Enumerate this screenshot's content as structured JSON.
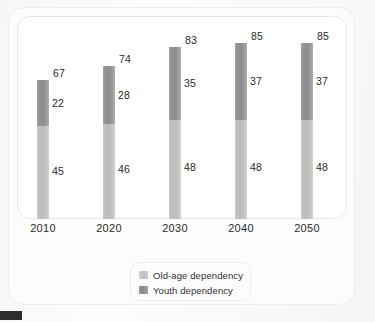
{
  "chart_data": {
    "type": "bar",
    "subtype": "stacked-bar-vertical",
    "title": "",
    "subtitle": "",
    "xlabel": "",
    "ylabel": "",
    "grid": false,
    "axis_visible": false,
    "ylim": [
      0,
      90
    ],
    "stack_order_bottom_to_top": [
      "Old-age dependency",
      "Youth dependency"
    ],
    "categories": [
      "2010",
      "2020",
      "2030",
      "2040",
      "2050"
    ],
    "series": [
      {
        "name": "Old-age dependency",
        "color": "#c2c3c1",
        "values": [
          45,
          46,
          48,
          48,
          48
        ]
      },
      {
        "name": "Youth dependency",
        "color": "#909090",
        "values": [
          22,
          28,
          35,
          37,
          37
        ]
      }
    ],
    "totals": [
      67,
      74,
      83,
      85,
      85
    ],
    "legend": {
      "position": "bottom-center",
      "entries": [
        {
          "label": "Old-age dependency",
          "swatch": "light-gray-swatch",
          "color": "#c2c3c1"
        },
        {
          "label": "Youth dependency",
          "swatch": "dark-gray-swatch",
          "color": "#909090"
        }
      ]
    },
    "annotations": [
      {
        "category": "2010",
        "total_label": "67",
        "youth_label": "22",
        "oldage_label": "45"
      },
      {
        "category": "2020",
        "total_label": "74",
        "youth_label": "28",
        "oldage_label": "46"
      },
      {
        "category": "2030",
        "total_label": "83",
        "youth_label": "35",
        "oldage_label": "48"
      },
      {
        "category": "2040",
        "total_label": "85",
        "youth_label": "37",
        "oldage_label": "48"
      },
      {
        "category": "2050",
        "total_label": "85",
        "youth_label": "37",
        "oldage_label": "48"
      }
    ]
  },
  "bars": [
    {
      "category": "2010",
      "total": "67",
      "youth": "22",
      "oldage": "45"
    },
    {
      "category": "2020",
      "total": "74",
      "youth": "28",
      "oldage": "46"
    },
    {
      "category": "2030",
      "total": "83",
      "youth": "35",
      "oldage": "48"
    },
    {
      "category": "2040",
      "total": "85",
      "youth": "37",
      "oldage": "48"
    },
    {
      "category": "2050",
      "total": "85",
      "youth": "37",
      "oldage": "48"
    }
  ],
  "xaxis": {
    "ticks": [
      "2010",
      "2020",
      "2030",
      "2040",
      "2050"
    ]
  },
  "legend": {
    "oldage_label": "Old-age dependency",
    "youth_label": "Youth dependency"
  },
  "colors": {
    "oldage": "#c2c3c1",
    "youth": "#909090",
    "frame": "#eceded",
    "panel_border": "#e7e8e8",
    "text": "#2a2a2a",
    "page": "#fdfdfd",
    "corner_mark": "#2d2d2d"
  },
  "scale": {
    "px_per_unit": 2.07,
    "plot_height_px": 203
  }
}
